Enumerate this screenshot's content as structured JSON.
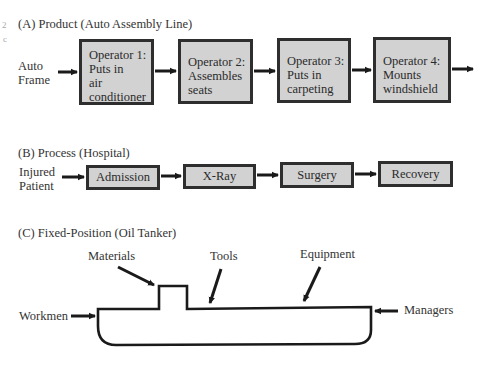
{
  "margin_marks": [
    "2",
    "c"
  ],
  "product": {
    "title": "(A)  Product (Auto Assembly Line)",
    "input_label": [
      "Auto",
      "Frame"
    ],
    "operators": [
      {
        "lines": [
          "Operator 1:",
          "Puts in",
          "air",
          "conditioner"
        ]
      },
      {
        "lines": [
          "Operator 2:",
          "Assembles",
          "seats"
        ]
      },
      {
        "lines": [
          "Operator 3:",
          "Puts in",
          "carpeting"
        ]
      },
      {
        "lines": [
          "Operator 4:",
          "Mounts",
          "windshield"
        ]
      }
    ]
  },
  "process": {
    "title": "(B)  Process (Hospital)",
    "input_label": [
      "Injured",
      "Patient"
    ],
    "steps": [
      "Admission",
      "X-Ray",
      "Surgery",
      "Recovery"
    ]
  },
  "fixed_position": {
    "title": "(C)  Fixed-Position (Oil Tanker)",
    "labels": {
      "materials": "Materials",
      "tools": "Tools",
      "equipment": "Equipment",
      "workmen": "Workmen",
      "managers": "Managers"
    }
  },
  "colors": {
    "box_fill": "#d2d2d2",
    "box_border": "#2e2e2e",
    "line": "#1a1a1a"
  }
}
